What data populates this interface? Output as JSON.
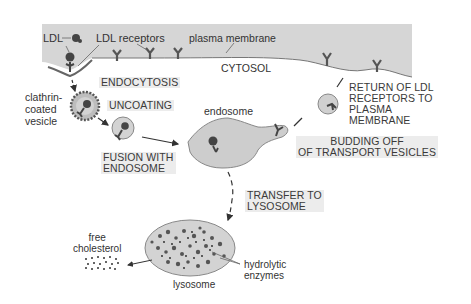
{
  "diagram": {
    "labels": {
      "ldl": "LDL",
      "ldl_receptors": "LDL receptors",
      "plasma_membrane": "plasma membrane",
      "cytosol": "CYTOSOL",
      "clathrin_coated_vesicle": [
        "clathrin-",
        "coated",
        "vesicle"
      ],
      "endosome": "endosome",
      "free_cholesterol": [
        "free",
        "cholesterol"
      ],
      "lysosome": "lysosome",
      "hydrolytic_enzymes": [
        "hydrolytic",
        "enzymes"
      ]
    },
    "steps": {
      "endocytosis": "ENDOCYTOSIS",
      "uncoating": "UNCOATING",
      "fusion": [
        "FUSION WITH",
        "ENDOSOME"
      ],
      "return": [
        "RETURN OF LDL",
        "RECEPTORS TO",
        "PLASMA",
        "MEMBRANE"
      ],
      "budding": [
        "BUDDING OFF",
        "OF TRANSPORT VESICLES"
      ],
      "transfer": [
        "TRANSFER TO",
        "LYSOSOME"
      ]
    },
    "colors": {
      "membrane_fill": "#d4d4d4",
      "organelle_fill": "#cfcfcf",
      "receptor": "#555555",
      "text": "#333333"
    }
  }
}
